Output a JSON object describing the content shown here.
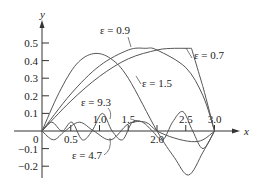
{
  "chart_data": {
    "type": "line",
    "title": "",
    "xlabel": "x",
    "ylabel": "y",
    "xlim": [
      0,
      3.3
    ],
    "ylim": [
      -0.25,
      0.55
    ],
    "grid": false,
    "legend": "inline annotations",
    "x_ticks": [
      "0.5",
      "1.0",
      "1.5",
      "2.0",
      "2.5",
      "3.0"
    ],
    "y_ticks": [
      "0.5",
      "0.4",
      "0.3",
      "0.2",
      "0.1",
      "-0.1",
      "-0.2"
    ],
    "origin_label": "0",
    "series": [
      {
        "name": "ε = 0.7",
        "x": [
          0,
          0.5,
          1.0,
          1.5,
          2.0,
          2.3,
          2.6,
          2.8,
          3.0
        ],
        "y": [
          0,
          0.17,
          0.31,
          0.41,
          0.46,
          0.47,
          0.47,
          0.25,
          0.0
        ]
      },
      {
        "name": "ε = 0.9",
        "x": [
          0,
          0.5,
          1.0,
          1.5,
          1.8,
          2.0,
          2.5,
          2.8,
          3.0
        ],
        "y": [
          0,
          0.21,
          0.37,
          0.46,
          0.47,
          0.46,
          0.36,
          0.2,
          0.0
        ]
      },
      {
        "name": "ε = 1.5",
        "x": [
          0,
          0.3,
          0.6,
          0.9,
          1.2,
          1.5,
          2.0,
          2.3,
          2.55,
          2.8,
          3.0
        ],
        "y": [
          0,
          0.22,
          0.38,
          0.44,
          0.41,
          0.3,
          0.0,
          -0.15,
          -0.25,
          -0.12,
          0.0
        ]
      },
      {
        "name": "ε = 4.7",
        "x": [
          0,
          0.2,
          0.4,
          0.65,
          0.9,
          1.2,
          1.5,
          1.8,
          2.0,
          2.3,
          2.6,
          2.8,
          3.0
        ],
        "y": [
          0,
          -0.05,
          0.0,
          0.05,
          0.0,
          -0.05,
          0.04,
          0.05,
          0.0,
          -0.04,
          -0.06,
          -0.05,
          0.0
        ]
      },
      {
        "name": "ε = 9.3",
        "x": [
          0,
          0.17,
          0.35,
          0.52,
          0.7,
          0.87,
          1.05,
          1.22,
          1.4,
          1.57,
          1.75,
          1.92,
          2.1,
          2.27,
          2.45,
          2.62,
          2.8,
          3.0
        ],
        "y": [
          0,
          0.05,
          0.0,
          0.05,
          -0.05,
          0.0,
          0.1,
          0.0,
          -0.05,
          0.05,
          0.05,
          0.0,
          -0.05,
          0.05,
          0.11,
          0.0,
          -0.1,
          0.0
        ]
      }
    ],
    "annotations": [
      {
        "text": "ε = 0.9",
        "x": 1.08,
        "y": 0.55
      },
      {
        "text": "ε = 0.7",
        "x": 2.75,
        "y": 0.41
      },
      {
        "text": "ε = 1.5",
        "x": 1.85,
        "y": 0.27
      },
      {
        "text": "ε = 9.3",
        "x": 0.6,
        "y": 0.13
      },
      {
        "text": "ε = 4.7",
        "x": 0.35,
        "y": -0.15
      }
    ]
  }
}
